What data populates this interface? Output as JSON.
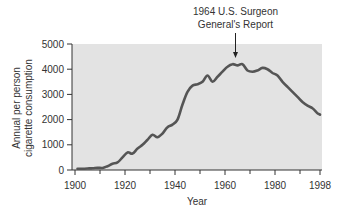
{
  "chart_data": {
    "type": "line",
    "title": "",
    "xlabel": "Year",
    "ylabel": "Annual per person cigarette consumption",
    "ylabel_lines": [
      "Annual per person",
      "cigarette consumption"
    ],
    "xlim": [
      1900,
      1998
    ],
    "ylim": [
      0,
      5000
    ],
    "x_ticks": [
      1900,
      1920,
      1940,
      1960,
      1980,
      1998
    ],
    "x_minor_ticks": [
      1910,
      1930,
      1950,
      1970,
      1990
    ],
    "y_ticks": [
      0,
      1000,
      2000,
      3000,
      4000,
      5000
    ],
    "grid": false,
    "legend": null,
    "annotation": {
      "lines": [
        "1964 U.S. Surgeon",
        "General's Report"
      ],
      "x": 1964
    },
    "series": [
      {
        "name": "Annual per person cigarette consumption",
        "x": [
          1901,
          1903,
          1905,
          1907,
          1909,
          1911,
          1913,
          1915,
          1917,
          1919,
          1921,
          1923,
          1925,
          1927,
          1929,
          1931,
          1933,
          1935,
          1937,
          1939,
          1941,
          1943,
          1945,
          1947,
          1949,
          1951,
          1953,
          1955,
          1957,
          1959,
          1961,
          1963,
          1965,
          1967,
          1969,
          1971,
          1973,
          1975,
          1977,
          1979,
          1981,
          1983,
          1985,
          1987,
          1989,
          1991,
          1993,
          1995,
          1997,
          1998
        ],
        "values": [
          50,
          50,
          60,
          70,
          90,
          80,
          150,
          250,
          300,
          500,
          700,
          650,
          850,
          1000,
          1200,
          1400,
          1300,
          1450,
          1700,
          1800,
          2000,
          2600,
          3100,
          3350,
          3400,
          3500,
          3750,
          3500,
          3700,
          3900,
          4100,
          4200,
          4150,
          4200,
          3950,
          3900,
          3950,
          4050,
          4000,
          3850,
          3750,
          3500,
          3300,
          3100,
          2900,
          2700,
          2550,
          2450,
          2250,
          2200
        ]
      }
    ],
    "colors": {
      "plot_bg": "#e3e3e3",
      "line": "#555555",
      "axis": "#333333",
      "text": "#333333"
    }
  }
}
